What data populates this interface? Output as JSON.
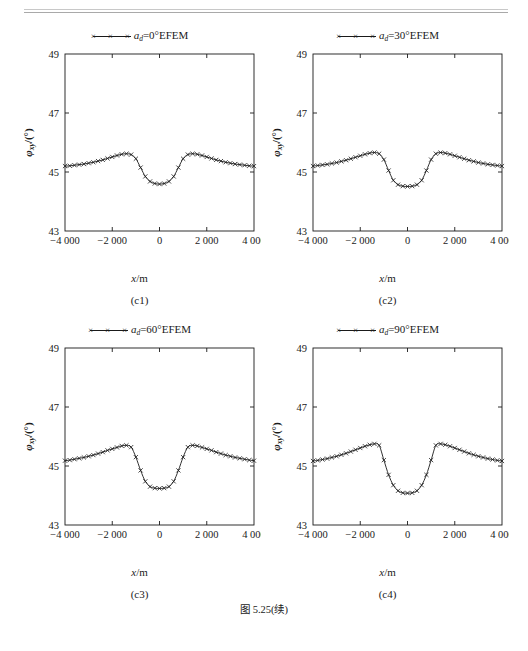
{
  "page": {
    "header_text": "· · · · · ·",
    "figure_caption": "图 5.25(续)"
  },
  "axes": {
    "xlabel": "x/m",
    "ylabel": "φxy/(°)",
    "ylabel_main": "φ",
    "ylabel_sub": "xy",
    "ylabel_unit": "/(°)",
    "xticks": [
      "−4 000",
      "−2 000",
      "0",
      "2 000",
      "4 000"
    ],
    "yticks": [
      "43",
      "45",
      "47",
      "49"
    ],
    "xlim": [
      -4000,
      4000
    ],
    "ylim": [
      43,
      49
    ],
    "legend_marker": "×"
  },
  "chart_data": [
    {
      "type": "line",
      "panel": "c1",
      "subcaption": "(c1)",
      "title": "",
      "legend": [
        "ad=0°EFEM"
      ],
      "legend_prefix": "a",
      "legend_sub": "d",
      "legend_suffix": "=0°EFEM",
      "xlabel": "x/m",
      "ylabel": "φxy/(°)",
      "xlim": [
        -4000,
        4000
      ],
      "ylim": [
        43,
        49
      ],
      "grid": false,
      "legend_position": "above-center",
      "marker": "x",
      "x": [
        -4000,
        -3800,
        -3600,
        -3400,
        -3200,
        -3000,
        -2800,
        -2600,
        -2400,
        -2200,
        -2000,
        -1800,
        -1600,
        -1400,
        -1200,
        -1000,
        -800,
        -600,
        -400,
        -200,
        0,
        200,
        400,
        600,
        800,
        1000,
        1200,
        1400,
        1600,
        1800,
        2000,
        2200,
        2400,
        2600,
        2800,
        3000,
        3200,
        3400,
        3600,
        3800,
        4000
      ],
      "values": [
        45.2,
        45.21,
        45.23,
        45.25,
        45.27,
        45.3,
        45.33,
        45.37,
        45.41,
        45.46,
        45.51,
        45.56,
        45.6,
        45.62,
        45.59,
        45.45,
        45.15,
        44.85,
        44.68,
        44.61,
        44.59,
        44.61,
        44.68,
        44.85,
        45.15,
        45.45,
        45.59,
        45.62,
        45.6,
        45.56,
        45.51,
        45.46,
        45.41,
        45.37,
        45.33,
        45.3,
        45.27,
        45.25,
        45.23,
        45.21,
        45.2
      ]
    },
    {
      "type": "line",
      "panel": "c2",
      "subcaption": "(c2)",
      "title": "",
      "legend": [
        "ad=30°EFEM"
      ],
      "legend_prefix": "a",
      "legend_sub": "d",
      "legend_suffix": "=30°EFEM",
      "xlabel": "x/m",
      "ylabel": "φxy/(°)",
      "xlim": [
        -4000,
        4000
      ],
      "ylim": [
        43,
        49
      ],
      "grid": false,
      "legend_position": "above-center",
      "marker": "x",
      "x": [
        -4000,
        -3800,
        -3600,
        -3400,
        -3200,
        -3000,
        -2800,
        -2600,
        -2400,
        -2200,
        -2000,
        -1800,
        -1600,
        -1400,
        -1200,
        -1000,
        -800,
        -600,
        -400,
        -200,
        0,
        200,
        400,
        600,
        800,
        1000,
        1200,
        1400,
        1600,
        1800,
        2000,
        2200,
        2400,
        2600,
        2800,
        3000,
        3200,
        3400,
        3600,
        3800,
        4000
      ],
      "values": [
        45.2,
        45.22,
        45.24,
        45.26,
        45.29,
        45.32,
        45.36,
        45.4,
        45.45,
        45.5,
        45.55,
        45.6,
        45.64,
        45.66,
        45.62,
        45.42,
        45.05,
        44.72,
        44.57,
        44.52,
        44.51,
        44.52,
        44.57,
        44.72,
        45.05,
        45.42,
        45.62,
        45.66,
        45.64,
        45.6,
        45.55,
        45.5,
        45.45,
        45.4,
        45.36,
        45.32,
        45.29,
        45.26,
        45.24,
        45.22,
        45.2
      ]
    },
    {
      "type": "line",
      "panel": "c3",
      "subcaption": "(c3)",
      "title": "",
      "legend": [
        "ad=60°EFEM"
      ],
      "legend_prefix": "a",
      "legend_sub": "d",
      "legend_suffix": "=60°EFEM",
      "xlabel": "x/m",
      "ylabel": "φxy/(°)",
      "xlim": [
        -4000,
        4000
      ],
      "ylim": [
        43,
        49
      ],
      "grid": false,
      "legend_position": "above-center",
      "marker": "x",
      "x": [
        -4000,
        -3800,
        -3600,
        -3400,
        -3200,
        -3000,
        -2800,
        -2600,
        -2400,
        -2200,
        -2000,
        -1800,
        -1600,
        -1400,
        -1200,
        -1000,
        -800,
        -600,
        -400,
        -200,
        0,
        200,
        400,
        600,
        800,
        1000,
        1200,
        1400,
        1600,
        1800,
        2000,
        2200,
        2400,
        2600,
        2800,
        3000,
        3200,
        3400,
        3600,
        3800,
        4000
      ],
      "values": [
        45.18,
        45.2,
        45.23,
        45.26,
        45.29,
        45.33,
        45.37,
        45.42,
        45.47,
        45.53,
        45.58,
        45.63,
        45.68,
        45.7,
        45.64,
        45.3,
        44.85,
        44.48,
        44.3,
        44.25,
        44.24,
        44.25,
        44.3,
        44.48,
        44.85,
        45.3,
        45.64,
        45.7,
        45.68,
        45.63,
        45.58,
        45.53,
        45.47,
        45.42,
        45.37,
        45.33,
        45.29,
        45.26,
        45.23,
        45.2,
        45.18
      ]
    },
    {
      "type": "line",
      "panel": "c4",
      "subcaption": "(c4)",
      "title": "",
      "legend": [
        "ad=90°EFEM"
      ],
      "legend_prefix": "a",
      "legend_sub": "d",
      "legend_suffix": "=90°EFEM",
      "xlabel": "x/m",
      "ylabel": "φxy/(°)",
      "xlim": [
        -4000,
        4000
      ],
      "ylim": [
        43,
        49
      ],
      "grid": false,
      "legend_position": "above-center",
      "marker": "x",
      "x": [
        -4000,
        -3800,
        -3600,
        -3400,
        -3200,
        -3000,
        -2800,
        -2600,
        -2400,
        -2200,
        -2000,
        -1800,
        -1600,
        -1400,
        -1200,
        -1000,
        -800,
        -600,
        -400,
        -200,
        0,
        200,
        400,
        600,
        800,
        1000,
        1200,
        1400,
        1600,
        1800,
        2000,
        2200,
        2400,
        2600,
        2800,
        3000,
        3200,
        3400,
        3600,
        3800,
        4000
      ],
      "values": [
        45.17,
        45.19,
        45.22,
        45.25,
        45.29,
        45.33,
        45.38,
        45.43,
        45.49,
        45.55,
        45.61,
        45.67,
        45.72,
        45.75,
        45.7,
        45.2,
        44.7,
        44.35,
        44.16,
        44.09,
        44.08,
        44.09,
        44.16,
        44.35,
        44.7,
        45.2,
        45.7,
        45.75,
        45.72,
        45.67,
        45.61,
        45.55,
        45.49,
        45.43,
        45.38,
        45.33,
        45.29,
        45.25,
        45.22,
        45.19,
        45.17
      ]
    }
  ]
}
